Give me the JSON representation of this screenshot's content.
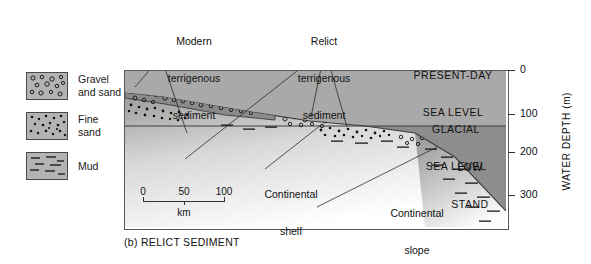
{
  "figure": {
    "caption": "(b) RELICT SEDIMENT"
  },
  "legend": {
    "items": [
      {
        "pattern": "gravel-and-sand",
        "label_line1": "Gravel",
        "label_line2": "and sand"
      },
      {
        "pattern": "fine-sand",
        "label_line1": "Fine",
        "label_line2": "sand"
      },
      {
        "pattern": "mud",
        "label_line1": "Mud",
        "label_line2": ""
      }
    ]
  },
  "annotations": {
    "modern": {
      "line1": "Modern",
      "line2": "terrigenous",
      "line3": "sediment"
    },
    "relict": {
      "line1": "Relict",
      "line2": "terrigenous",
      "line3": "sediment"
    },
    "shelf": {
      "line1": "Continental",
      "line2": "shelf"
    },
    "slope": {
      "line1": "Continental",
      "line2": "slope"
    }
  },
  "sea_levels": {
    "present": {
      "line1": "PRESENT-DAY",
      "line2": "SEA LEVEL"
    },
    "glacial": {
      "line1": "GLACIAL",
      "line2": "SEA LEVEL"
    },
    "lowstand": {
      "line1": "LOW",
      "line2": "STAND"
    }
  },
  "depth_axis": {
    "title": "WATER DEPTH (m)",
    "ticks": [
      "0",
      "100",
      "200",
      "300"
    ]
  },
  "scale_bar": {
    "ticks": [
      "0",
      "50",
      "100"
    ],
    "unit": "km"
  },
  "colors": {
    "water_upper": "#a9a9a9",
    "water_lower": "#8d8d8d",
    "sediment_dark": "#8a8a8a",
    "swatch_fill": "#b3b3b3",
    "outline": "#4a4a4a"
  }
}
